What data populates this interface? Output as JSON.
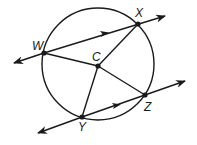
{
  "diagram": {
    "type": "circle-geometry",
    "circle": {
      "center": "C",
      "cx": 98,
      "cy": 64,
      "r": 56
    },
    "points": [
      {
        "id": "W",
        "label": "W",
        "x": 44,
        "y": 53
      },
      {
        "id": "X",
        "label": "X",
        "x": 138,
        "y": 24
      },
      {
        "id": "C",
        "label": "C",
        "x": 98,
        "y": 66
      },
      {
        "id": "Z",
        "label": "Z",
        "x": 145,
        "y": 95
      },
      {
        "id": "Y",
        "label": "Y",
        "x": 82,
        "y": 117
      }
    ],
    "lines": [
      {
        "name": "line WX",
        "through": [
          "W",
          "X"
        ],
        "parallel_mark": true
      },
      {
        "name": "line YZ",
        "through": [
          "Y",
          "Z"
        ],
        "parallel_mark": true
      }
    ],
    "segments": [
      "CW",
      "CX",
      "CY",
      "CZ"
    ],
    "colors": {
      "stroke": "#1a1a1a",
      "background": "#ffffff"
    }
  }
}
